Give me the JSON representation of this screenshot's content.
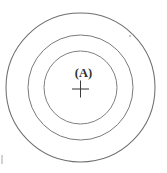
{
  "figure": {
    "center_label": "(A)",
    "center_marker": "cross-marker",
    "background_color": "#ffffff",
    "line_color": "#7c7c7c",
    "marker_color": "#3b3b3b",
    "label_color": "#2f2f2f"
  },
  "chart_data": {
    "type": "diagram",
    "title": "",
    "center": {
      "x": 80.5,
      "y": 87.5
    },
    "rings": [
      {
        "name": "outer-circle",
        "radius": 74.5,
        "stroke": "#6f6f6f"
      },
      {
        "name": "middle-circle",
        "radius": 52.5,
        "stroke": "#7a7a7a"
      },
      {
        "name": "inner-circle",
        "radius": 36.5,
        "stroke": "#808080"
      }
    ],
    "annotations": [
      {
        "name": "center-label",
        "text": "(A)",
        "x": 80.5,
        "y": 73
      },
      {
        "name": "center-cross",
        "text": "+",
        "x": 80.5,
        "y": 89,
        "size": 17
      }
    ],
    "specks": [
      {
        "name": "speck-upper-right",
        "x": 130,
        "y": 36,
        "r": 1.1
      }
    ]
  }
}
